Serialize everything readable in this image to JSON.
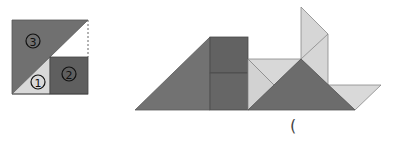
{
  "colors": {
    "dark": "#6e6e6e",
    "darker": "#5f5f5f",
    "light": "#d6d6d6",
    "lighter": "#e4e4e4",
    "edge": "#8a8a8a"
  },
  "left_figure": {
    "description": "Square split into three pieces",
    "pieces": [
      {
        "id": "1",
        "label": "①",
        "shape": "triangle",
        "shade": "light"
      },
      {
        "id": "2",
        "label": "②",
        "shape": "square",
        "shade": "dark"
      },
      {
        "id": "3",
        "label": "③",
        "shape": "triangle",
        "shade": "dark"
      }
    ]
  },
  "right_figure": {
    "description": "Composite shape assembled from tangram-like pieces"
  },
  "answer_blank": {
    "open_paren": "("
  }
}
